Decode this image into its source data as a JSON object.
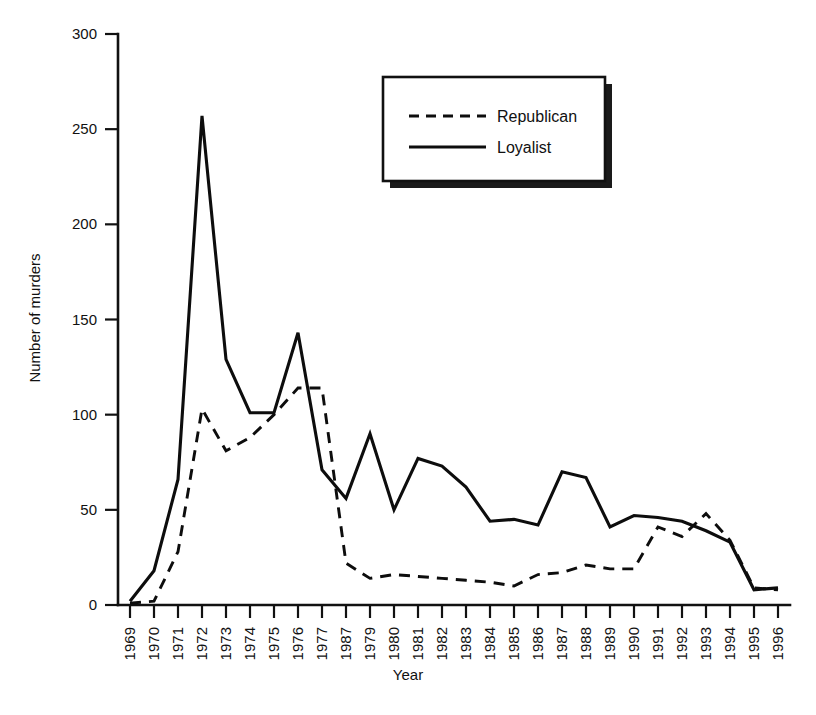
{
  "chart_data": {
    "type": "line",
    "title": "",
    "xlabel": "Year",
    "ylabel": "Number of murders",
    "grid": false,
    "legend_position": "top-right",
    "xlim": [
      1969,
      1996
    ],
    "ylim": [
      0,
      300
    ],
    "ytick_values": [
      0,
      50,
      100,
      150,
      200,
      250,
      300
    ],
    "ytick_labels": [
      "0",
      "50",
      "100",
      "150",
      "200",
      "250",
      "300"
    ],
    "categories": [
      "1969",
      "1970",
      "1971",
      "1972",
      "1973",
      "1974",
      "1975",
      "1976",
      "1977",
      "1987",
      "1979",
      "1980",
      "1981",
      "1982",
      "1983",
      "1984",
      "1985",
      "1986",
      "1987",
      "1988",
      "1989",
      "1990",
      "1991",
      "1992",
      "1993",
      "1994",
      "1995",
      "1996"
    ],
    "series": [
      {
        "name": "Republican",
        "style": "dashed",
        "values": [
          1,
          2,
          28,
          103,
          81,
          88,
          100,
          114,
          114,
          22,
          14,
          16,
          15,
          14,
          13,
          12,
          10,
          16,
          17,
          21,
          19,
          19,
          41,
          36,
          48,
          34,
          9,
          8
        ]
      },
      {
        "name": "Loyalist",
        "style": "solid",
        "values": [
          2,
          18,
          66,
          257,
          129,
          101,
          101,
          143,
          71,
          56,
          90,
          50,
          77,
          73,
          62,
          44,
          45,
          42,
          70,
          67,
          41,
          47,
          46,
          44,
          39,
          33,
          8,
          9
        ]
      }
    ]
  },
  "axes": {
    "y_title": "Number of murders",
    "x_title": "Year"
  },
  "legend": {
    "entries": [
      {
        "label": "Republican",
        "style": "dashed"
      },
      {
        "label": "Loyalist",
        "style": "solid"
      }
    ]
  },
  "colors": {
    "ink": "#111111",
    "background": "#ffffff",
    "series_stroke": "#0d0d0d",
    "legend_shadow": "#1a1a1a"
  }
}
